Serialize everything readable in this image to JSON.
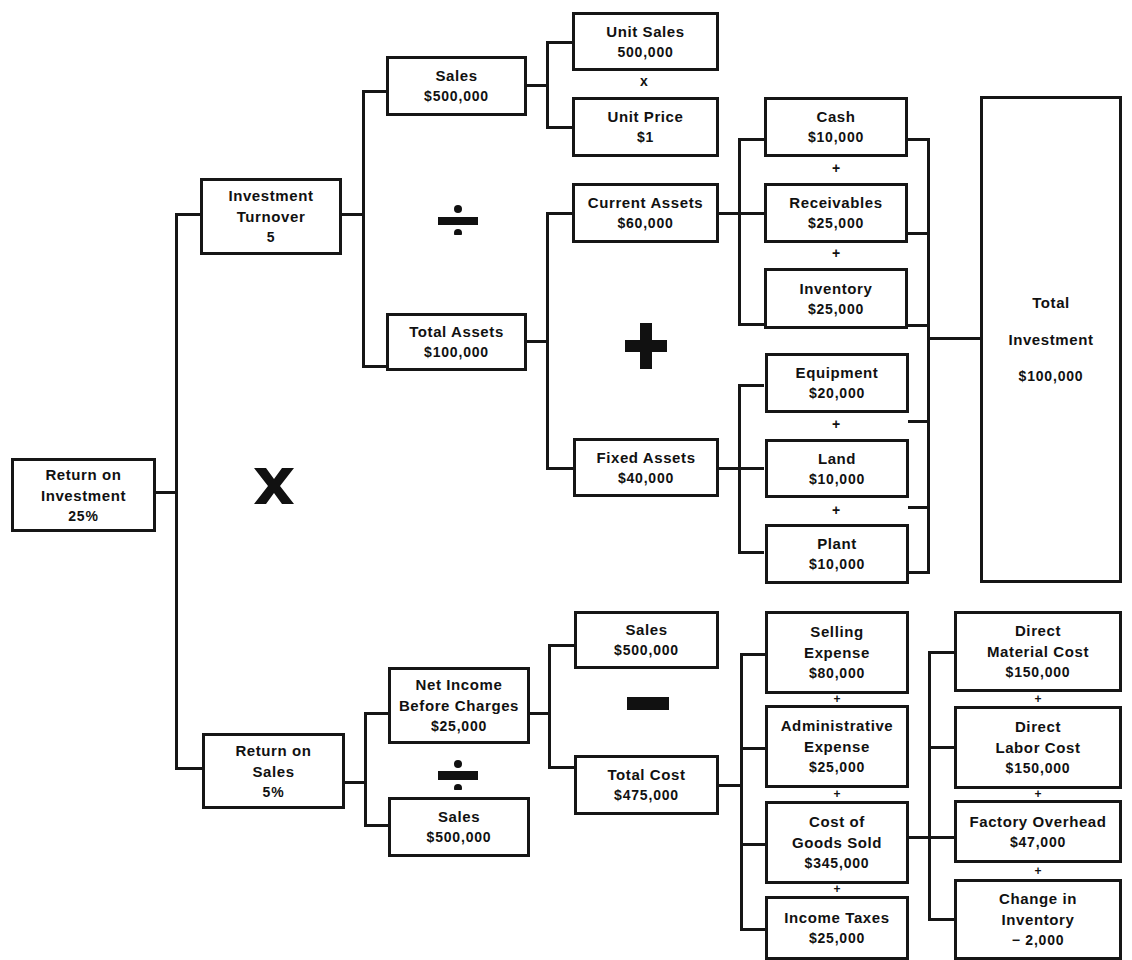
{
  "diagram": {
    "nodes": {
      "roi": {
        "label1": "Return on",
        "label2": "Investment",
        "value": "25%"
      },
      "investment_turnover": {
        "label1": "Investment",
        "label2": "Turnover",
        "value": "5"
      },
      "return_on_sales": {
        "label1": "Return on",
        "label2": "Sales",
        "value": "5%"
      },
      "sales_top": {
        "label": "Sales",
        "value": "$500,000"
      },
      "total_assets": {
        "label": "Total Assets",
        "value": "$100,000"
      },
      "net_income": {
        "label1": "Net Income",
        "label2": "Before Charges",
        "value": "$25,000"
      },
      "sales_bottom": {
        "label": "Sales",
        "value": "$500,000"
      },
      "unit_sales": {
        "label": "Unit Sales",
        "value": "500,000"
      },
      "unit_price": {
        "label": "Unit Price",
        "value": "$1"
      },
      "current_assets": {
        "label": "Current Assets",
        "value": "$60,000"
      },
      "fixed_assets": {
        "label": "Fixed Assets",
        "value": "$40,000"
      },
      "cash": {
        "label": "Cash",
        "value": "$10,000"
      },
      "receivables": {
        "label": "Receivables",
        "value": "$25,000"
      },
      "inventory": {
        "label": "Inventory",
        "value": "$25,000"
      },
      "equipment": {
        "label": "Equipment",
        "value": "$20,000"
      },
      "land": {
        "label": "Land",
        "value": "$10,000"
      },
      "plant": {
        "label": "Plant",
        "value": "$10,000"
      },
      "total_investment": {
        "label1": "Total",
        "label2": "Investment",
        "value": "$100,000"
      },
      "sales_cost_side": {
        "label": "Sales",
        "value": "$500,000"
      },
      "total_cost": {
        "label": "Total Cost",
        "value": "$475,000"
      },
      "selling_expense": {
        "label1": "Selling",
        "label2": "Expense",
        "value": "$80,000"
      },
      "admin_expense": {
        "label1": "Administrative",
        "label2": "Expense",
        "value": "$25,000"
      },
      "cogs": {
        "label1": "Cost of",
        "label2": "Goods Sold",
        "value": "$345,000"
      },
      "income_taxes": {
        "label": "Income Taxes",
        "value": "$25,000"
      },
      "direct_material": {
        "label1": "Direct",
        "label2": "Material Cost",
        "value": "$150,000"
      },
      "direct_labor": {
        "label1": "Direct",
        "label2": "Labor Cost",
        "value": "$150,000"
      },
      "factory_overhead": {
        "label": "Factory Overhead",
        "value": "$47,000"
      },
      "change_inventory": {
        "label1": "Change in",
        "label2": "Inventory",
        "value": "− 2,000"
      }
    },
    "operators": {
      "multiply_big": "x",
      "multiply_small": "x",
      "divide": "÷",
      "plus": "+",
      "minus": "−"
    }
  }
}
